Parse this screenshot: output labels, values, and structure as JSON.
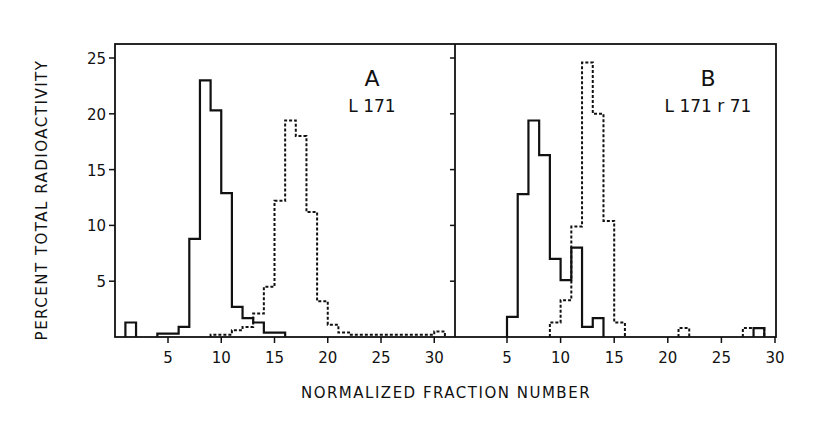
{
  "chart_data": [
    {
      "type": "bar",
      "style": "step-histogram",
      "panel": "A",
      "title": "A",
      "subtitle": "L 171",
      "xlabel": "NORMALIZED FRACTION NUMBER",
      "ylabel": "PERCENT TOTAL RADIOACTIVITY",
      "xlim": [
        0,
        32
      ],
      "ylim": [
        0,
        26
      ],
      "xticks": [
        5,
        10,
        15,
        20,
        25,
        30
      ],
      "yticks": [
        5,
        10,
        15,
        20,
        25
      ],
      "grid": false,
      "series": [
        {
          "name": "solid",
          "line": "solid",
          "bins": [
            {
              "x0": 1,
              "x1": 2,
              "y": 1.3
            },
            {
              "x0": 4,
              "x1": 6,
              "y": 0.3
            },
            {
              "x0": 6,
              "x1": 7,
              "y": 0.9
            },
            {
              "x0": 7,
              "x1": 8,
              "y": 8.8
            },
            {
              "x0": 8,
              "x1": 9,
              "y": 23.0
            },
            {
              "x0": 9,
              "x1": 10,
              "y": 20.3
            },
            {
              "x0": 10,
              "x1": 11,
              "y": 12.9
            },
            {
              "x0": 11,
              "x1": 12,
              "y": 2.7
            },
            {
              "x0": 12,
              "x1": 13,
              "y": 1.7
            },
            {
              "x0": 13,
              "x1": 14,
              "y": 1.3
            },
            {
              "x0": 14,
              "x1": 16,
              "y": 0.4
            }
          ]
        },
        {
          "name": "dashed",
          "line": "dashed",
          "bins": [
            {
              "x0": 9,
              "x1": 11,
              "y": 0.2
            },
            {
              "x0": 11,
              "x1": 12,
              "y": 0.6
            },
            {
              "x0": 12,
              "x1": 13,
              "y": 0.9
            },
            {
              "x0": 13,
              "x1": 14,
              "y": 2.1
            },
            {
              "x0": 14,
              "x1": 15,
              "y": 4.5
            },
            {
              "x0": 15,
              "x1": 16,
              "y": 12.2
            },
            {
              "x0": 16,
              "x1": 17,
              "y": 19.4
            },
            {
              "x0": 17,
              "x1": 18,
              "y": 18.0
            },
            {
              "x0": 18,
              "x1": 19,
              "y": 11.2
            },
            {
              "x0": 19,
              "x1": 20,
              "y": 3.2
            },
            {
              "x0": 20,
              "x1": 21,
              "y": 1.1
            },
            {
              "x0": 21,
              "x1": 22,
              "y": 0.4
            },
            {
              "x0": 22,
              "x1": 30,
              "y": 0.2
            },
            {
              "x0": 30,
              "x1": 31,
              "y": 0.5
            }
          ]
        }
      ]
    },
    {
      "type": "bar",
      "style": "step-histogram",
      "panel": "B",
      "title": "B",
      "subtitle": "L 171 r 71",
      "xlabel": "NORMALIZED FRACTION NUMBER",
      "xlim": [
        0,
        30
      ],
      "ylim": [
        0,
        26
      ],
      "xticks": [
        5,
        10,
        15,
        20,
        25,
        30
      ],
      "grid": false,
      "series": [
        {
          "name": "solid",
          "line": "solid",
          "bins": [
            {
              "x0": 5,
              "x1": 6,
              "y": 1.8
            },
            {
              "x0": 6,
              "x1": 7,
              "y": 12.8
            },
            {
              "x0": 7,
              "x1": 8,
              "y": 19.4
            },
            {
              "x0": 8,
              "x1": 9,
              "y": 16.3
            },
            {
              "x0": 9,
              "x1": 10,
              "y": 7.0
            },
            {
              "x0": 10,
              "x1": 11,
              "y": 5.1
            },
            {
              "x0": 11,
              "x1": 12,
              "y": 8.0
            },
            {
              "x0": 12,
              "x1": 13,
              "y": 0.9
            },
            {
              "x0": 13,
              "x1": 14,
              "y": 1.7
            },
            {
              "x0": 28,
              "x1": 29,
              "y": 0.8
            }
          ]
        },
        {
          "name": "dashed",
          "line": "dashed",
          "bins": [
            {
              "x0": 9,
              "x1": 10,
              "y": 1.3
            },
            {
              "x0": 10,
              "x1": 11,
              "y": 3.3
            },
            {
              "x0": 11,
              "x1": 12,
              "y": 9.9
            },
            {
              "x0": 12,
              "x1": 13,
              "y": 24.6
            },
            {
              "x0": 13,
              "x1": 14,
              "y": 20.0
            },
            {
              "x0": 14,
              "x1": 15,
              "y": 10.4
            },
            {
              "x0": 15,
              "x1": 16,
              "y": 1.3
            },
            {
              "x0": 21,
              "x1": 22,
              "y": 0.8
            },
            {
              "x0": 27,
              "x1": 29,
              "y": 0.8
            }
          ]
        }
      ]
    }
  ],
  "labels": {
    "ylabel": "PERCENT TOTAL RADIOACTIVITY",
    "xlabel": "NORMALIZED FRACTION NUMBER",
    "panel_a_letter": "A",
    "panel_a_sub": "L 171",
    "panel_b_letter": "B",
    "panel_b_sub": "L 171 r 71"
  }
}
